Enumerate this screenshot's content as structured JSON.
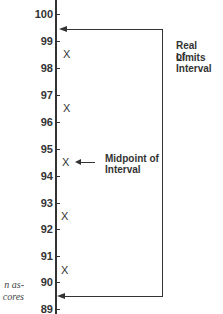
{
  "diagram": {
    "type": "interval-real-limits",
    "axis": {
      "ticks": [
        "100",
        "99",
        "98",
        "97",
        "96",
        "95",
        "94",
        "93",
        "92",
        "91",
        "90",
        "89"
      ]
    },
    "x_marks": [
      {
        "label": "X",
        "value": 98.5
      },
      {
        "label": "X",
        "value": 96.5
      },
      {
        "label": "X",
        "value": 94.5
      },
      {
        "label": "X",
        "value": 92.5
      },
      {
        "label": "X",
        "value": 90.5
      }
    ],
    "annotations": {
      "real_limits_line1": "Real Limits",
      "real_limits_line2": "of Interval",
      "midpoint_line1": "Midpoint of",
      "midpoint_line2": "Interval"
    },
    "real_limits": {
      "upper": 99.5,
      "lower": 89.5
    },
    "midpoint": 94.5,
    "side_text": {
      "line1": "n  as-",
      "line2": "cores"
    }
  }
}
